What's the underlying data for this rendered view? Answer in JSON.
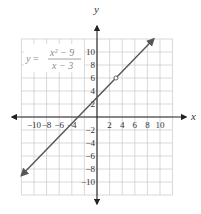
{
  "chart_data": {
    "type": "line",
    "title": "",
    "equation": {
      "lhs": "y =",
      "numerator": "x² − 9",
      "denominator": "x − 3"
    },
    "xlabel": "x",
    "ylabel": "y",
    "xlim": [
      -12,
      12
    ],
    "ylim": [
      -12,
      12
    ],
    "grid": true,
    "grid_step": 2,
    "x_tick_labels": [
      "−10",
      "−8",
      "−6",
      "−4",
      "2",
      "4",
      "6",
      "8",
      "10"
    ],
    "x_tick_values": [
      -10,
      -8,
      -6,
      -4,
      2,
      4,
      6,
      8,
      10
    ],
    "y_tick_labels": [
      "10",
      "8",
      "6",
      "4",
      "2",
      "−2",
      "−4",
      "−6",
      "−8",
      "−10"
    ],
    "y_tick_values": [
      10,
      8,
      6,
      4,
      2,
      -2,
      -4,
      -6,
      -8,
      -10
    ],
    "series": [
      {
        "name": "y = (x² − 9)/(x − 3)",
        "simplified": "y = x + 3, x ≠ 3",
        "x": [
          -12,
          9
        ],
        "y": [
          -9,
          12
        ],
        "arrows": "both",
        "color": "#555555"
      }
    ],
    "annotations": [
      {
        "type": "open-circle",
        "x": 3,
        "y": 6,
        "label": "hole"
      }
    ],
    "colors": {
      "grid": "#c8c8c8",
      "axes": "#222222",
      "line": "#555555",
      "equation_text": "#8a8a8a"
    }
  }
}
